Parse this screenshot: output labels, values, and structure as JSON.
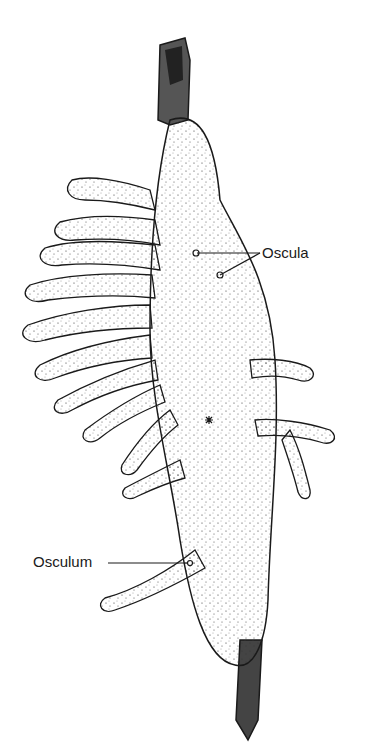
{
  "figure": {
    "labels": {
      "oscula": "Oscula",
      "osculum": "Osculum"
    },
    "colors": {
      "ink": "#1a1a1a",
      "background": "#ffffff",
      "branch": "#2a2a2a"
    }
  }
}
